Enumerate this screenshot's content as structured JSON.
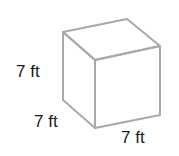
{
  "figure": {
    "shape": "cube",
    "edge_color": "#a9a9a9",
    "labels": {
      "height": "7 ft",
      "depth": "7 ft",
      "width": "7 ft"
    }
  }
}
